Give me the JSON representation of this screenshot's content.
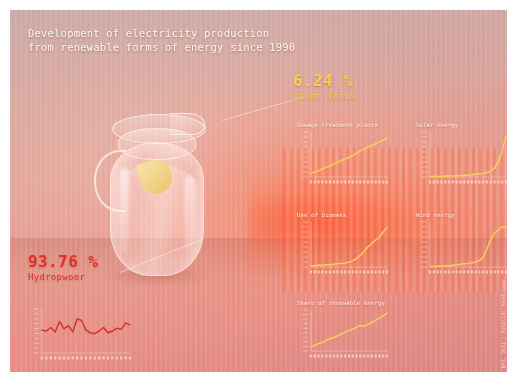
{
  "poster": {
    "title_line1": "Development of electricity production",
    "title_line2": "from renewable forms of energy since 1990",
    "credit": "BFE, 2011 / Fotolia: Ferdinand"
  },
  "callouts": {
    "other": {
      "value": "6.24 %",
      "label": "Other forms",
      "color": "#f2d24b"
    },
    "hydro": {
      "value": "93.76 %",
      "label": "Hydropwoer",
      "color": "#e0322a"
    }
  },
  "chart_data": [
    {
      "id": "sewage",
      "type": "line",
      "title": "Sewage treatment plants",
      "xlabel": "",
      "ylabel": "",
      "grid": false,
      "legend": "none",
      "color": "#f5cf5a",
      "categories": [
        "1990",
        "1991",
        "1992",
        "1993",
        "1994",
        "1995",
        "1996",
        "1997",
        "1998",
        "1999",
        "2000",
        "2001",
        "2002",
        "2003",
        "2004",
        "2005",
        "2006",
        "2007",
        "2008",
        "2009",
        "2010"
      ],
      "values": [
        8,
        11,
        14,
        18,
        22,
        25,
        29,
        33,
        36,
        40,
        44,
        48,
        53,
        58,
        62,
        67,
        70,
        74,
        78,
        82,
        86
      ],
      "ylim": [
        0,
        100
      ]
    },
    {
      "id": "solar",
      "type": "line",
      "title": "Solar energy",
      "xlabel": "",
      "ylabel": "",
      "grid": false,
      "legend": "none",
      "color": "#f5cf5a",
      "categories": [
        "1990",
        "1991",
        "1992",
        "1993",
        "1994",
        "1995",
        "1996",
        "1997",
        "1998",
        "1999",
        "2000",
        "2001",
        "2002",
        "2003",
        "2004",
        "2005",
        "2006",
        "2007",
        "2008",
        "2009",
        "2010"
      ],
      "values": [
        1,
        1,
        1,
        1,
        2,
        2,
        2,
        3,
        3,
        4,
        4,
        5,
        6,
        7,
        8,
        10,
        13,
        20,
        34,
        58,
        92
      ],
      "ylim": [
        0,
        100
      ]
    },
    {
      "id": "biomass",
      "type": "line",
      "title": "Use of biomass",
      "xlabel": "",
      "ylabel": "",
      "grid": false,
      "legend": "none",
      "color": "#f5cf5a",
      "categories": [
        "1990",
        "1991",
        "1992",
        "1993",
        "1994",
        "1995",
        "1996",
        "1997",
        "1998",
        "1999",
        "2000",
        "2001",
        "2002",
        "2003",
        "2004",
        "2005",
        "2006",
        "2007",
        "2008",
        "2009",
        "2010"
      ],
      "values": [
        3,
        3,
        4,
        4,
        5,
        5,
        6,
        7,
        8,
        9,
        11,
        14,
        19,
        26,
        35,
        45,
        52,
        60,
        66,
        78,
        88
      ],
      "ylim": [
        0,
        100
      ]
    },
    {
      "id": "wind",
      "type": "line",
      "title": "Wind energy",
      "xlabel": "",
      "ylabel": "",
      "grid": false,
      "legend": "none",
      "color": "#f5cf5a",
      "categories": [
        "1990",
        "1991",
        "1992",
        "1993",
        "1994",
        "1995",
        "1996",
        "1997",
        "1998",
        "1999",
        "2000",
        "2001",
        "2002",
        "2003",
        "2004",
        "2005",
        "2006",
        "2007",
        "2008",
        "2009",
        "2010"
      ],
      "values": [
        1,
        1,
        2,
        2,
        3,
        3,
        4,
        5,
        6,
        7,
        8,
        9,
        11,
        14,
        22,
        40,
        62,
        76,
        82,
        90,
        88
      ],
      "ylim": [
        0,
        100
      ]
    },
    {
      "id": "share",
      "type": "line",
      "title": "Share of renewable energy",
      "xlabel": "",
      "ylabel": "",
      "grid": false,
      "legend": "none",
      "color": "#f5cf5a",
      "categories": [
        "1990",
        "1991",
        "1992",
        "1993",
        "1994",
        "1995",
        "1996",
        "1997",
        "1998",
        "1999",
        "2000",
        "2001",
        "2002",
        "2003",
        "2004",
        "2005",
        "2006",
        "2007",
        "2008",
        "2009",
        "2010"
      ],
      "values": [
        10,
        14,
        18,
        21,
        26,
        30,
        33,
        37,
        42,
        46,
        50,
        53,
        58,
        62,
        61,
        65,
        70,
        75,
        80,
        86,
        92
      ],
      "ylim": [
        0,
        100
      ]
    },
    {
      "id": "hydro",
      "type": "line",
      "title": "",
      "xlabel": "",
      "ylabel": "",
      "grid": false,
      "legend": "none",
      "color": "#d8342c",
      "categories": [
        "1990",
        "1991",
        "1992",
        "1993",
        "1994",
        "1995",
        "1996",
        "1997",
        "1998",
        "1999",
        "2000",
        "2001",
        "2002",
        "2003",
        "2004",
        "2005",
        "2006",
        "2007",
        "2008",
        "2009",
        "2010"
      ],
      "values": [
        52,
        50,
        58,
        48,
        72,
        55,
        62,
        48,
        78,
        74,
        52,
        46,
        44,
        50,
        58,
        46,
        50,
        56,
        54,
        68,
        64
      ],
      "ylim": [
        0,
        100
      ]
    }
  ]
}
